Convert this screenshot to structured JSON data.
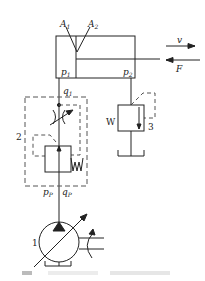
{
  "diagram": {
    "type": "hydraulic-circuit",
    "cylinder": {
      "area_labels": [
        "A",
        "A"
      ],
      "area_subscripts": [
        "1",
        "2"
      ],
      "pressure_labels": [
        "p",
        "p"
      ],
      "pressure_subscripts": [
        "1",
        "2"
      ]
    },
    "rod_annotations": {
      "velocity": "v",
      "force": "F"
    },
    "flow_label": {
      "main": "q",
      "sub": "1"
    },
    "pump_outlet": {
      "pressure": {
        "main": "p",
        "sub": "P"
      },
      "flow": {
        "main": "q",
        "sub": "P"
      }
    },
    "component_numbers": {
      "pump": "1",
      "flow_valve": "2",
      "back_pressure_valve": "3"
    },
    "spring_symbol": "W",
    "caption": ""
  },
  "colors": {
    "line": "#222222",
    "dashed": "#444444",
    "background": "#ffffff"
  }
}
